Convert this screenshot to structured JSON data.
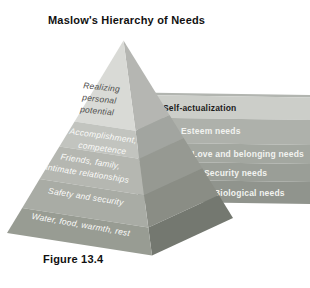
{
  "title": "Maslow's Hierarchy of Needs",
  "figure_caption": "Figure 13.4",
  "levels": [
    {
      "front_lines": [
        "Realizing",
        "personal",
        "potential"
      ],
      "side_label": "Self-actualization"
    },
    {
      "front_lines": [
        "Accomplishment,",
        "competence"
      ],
      "side_label": "Esteem needs"
    },
    {
      "front_lines": [
        "Friends, family,",
        "intimate relationships"
      ],
      "side_label": "Love and belonging needs"
    },
    {
      "front_lines": [
        "Safety and security"
      ],
      "side_label": "Security needs"
    },
    {
      "front_lines": [
        "Water, food, warmth, rest"
      ],
      "side_label": "Biological needs"
    }
  ],
  "colors": {
    "background": "#ffffff",
    "title_color": "#111111",
    "caption_color": "#111111",
    "front_faces": [
      "#d9dad6",
      "#c2c4bf",
      "#b5b7b1",
      "#a9aca5",
      "#989c93"
    ],
    "side_faces": [
      "#b5b6b2",
      "#a2a5a0",
      "#969992",
      "#8a8d85",
      "#747870"
    ],
    "band_faces": [
      "#cccec9",
      "#aeb1ab",
      "#a3a7a0",
      "#9a9e97",
      "#90948d"
    ],
    "band_top_lip": "#b2b5b0",
    "band_label_colors": [
      "#1c1c1c",
      "#f2f3f0",
      "#f2f3f0",
      "#f2f3f0",
      "#f2f3f0"
    ],
    "front_label_colors": [
      "#4e4e4c",
      "#fbfbf9",
      "#fbfbf9",
      "#fbfbf9",
      "#fbfbf9"
    ]
  }
}
